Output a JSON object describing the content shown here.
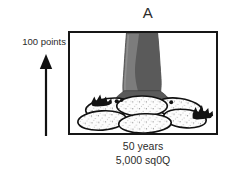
{
  "figure": {
    "panel_letter": "A",
    "axis": {
      "label": "100 points",
      "arrow_icon": "up-arrow-icon",
      "direction": "up"
    },
    "captions": [
      "50 years",
      "5,000 sq0Q"
    ],
    "illustration": {
      "name": "tree-trunk-on-boulders-illustration",
      "subject": "tree trunk rising from a cluster of speckled boulders",
      "elements": [
        "trunk",
        "boulders",
        "shrubs"
      ]
    },
    "colors": {
      "frame_border": "#161616",
      "background": "#ffffff",
      "text": "#2b2b2b",
      "trunk_light": "#7c7c7c",
      "trunk_dark": "#5a5a5a",
      "boulder_fill": "#fdfdfd",
      "outline": "#111111"
    }
  }
}
